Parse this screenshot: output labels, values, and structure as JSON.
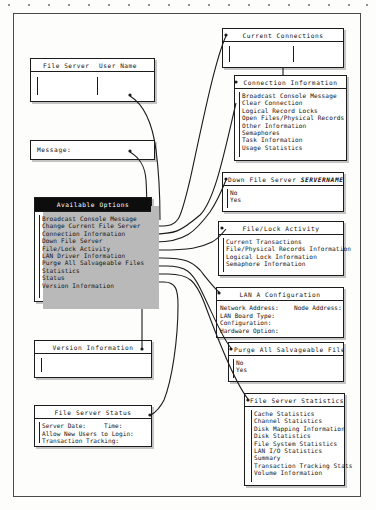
{
  "page": {
    "background_color": "#fdfdfc",
    "ink_color": "#111111"
  },
  "boxes": {
    "file_server_user_name": {
      "name": "File Server / User Name",
      "col1_label": "File Server",
      "col2_label": "User Name",
      "value_col1": "",
      "value_col2": ""
    },
    "message": {
      "title": "Message:",
      "value": ""
    },
    "available_options": {
      "title": "Available Options",
      "items": [
        "Broadcast Console Message",
        "Change Current File Server",
        "Connection Information",
        "Down File Server",
        "File/Lock Activity",
        "LAN Driver Information",
        "Purge All Salvageable Files",
        "Statistics",
        "Status",
        "Version Information"
      ]
    },
    "version_information": {
      "title": "Version Information",
      "value": ""
    },
    "file_server_status": {
      "title": "File Server Status",
      "fields": [
        "Server Date:",
        "Allow New Users to Login:",
        "Transaction Tracking:"
      ],
      "field_right": "Time:"
    },
    "current_connections": {
      "title": "Current Connections",
      "value_col1": "",
      "value_col2": ""
    },
    "connection_information": {
      "title": "Connection Information",
      "items": [
        "Broadcast Console Message",
        "Clear Connection",
        "Logical Record Locks",
        "Open Files/Physical Records",
        "Other Information",
        "Semaphores",
        "Task Information",
        "Usage Statistics"
      ]
    },
    "down_file_server": {
      "title": "Down File Server ",
      "title_server": "SERVERNAME",
      "items": [
        "No",
        "Yes"
      ]
    },
    "file_lock_activity": {
      "title": "File/Lock Activity",
      "items": [
        "Current Transactions",
        "File/Physical Records Information",
        "Logical Lock Information",
        "Semaphore Information"
      ]
    },
    "lan_a_configuration": {
      "title": "LAN A Configuration",
      "fields": [
        "Network Address:",
        "LAN Board Type:",
        "Configuration:",
        "Hardware Option:"
      ],
      "field_right": "Node Address:"
    },
    "purge_all_salvageable_files": {
      "title": "Purge All Salvageable Files",
      "items": [
        "No",
        "Yes"
      ]
    },
    "file_server_statistics": {
      "title": "File Server Statistics",
      "items": [
        "Cache Statistics",
        "Channel Statistics",
        "Disk Mapping Information",
        "Disk Statistics",
        "File System Statistics",
        "LAN I/O Statistics",
        "Summary",
        "Transaction Tracking Stats",
        "Volume Information"
      ]
    }
  }
}
